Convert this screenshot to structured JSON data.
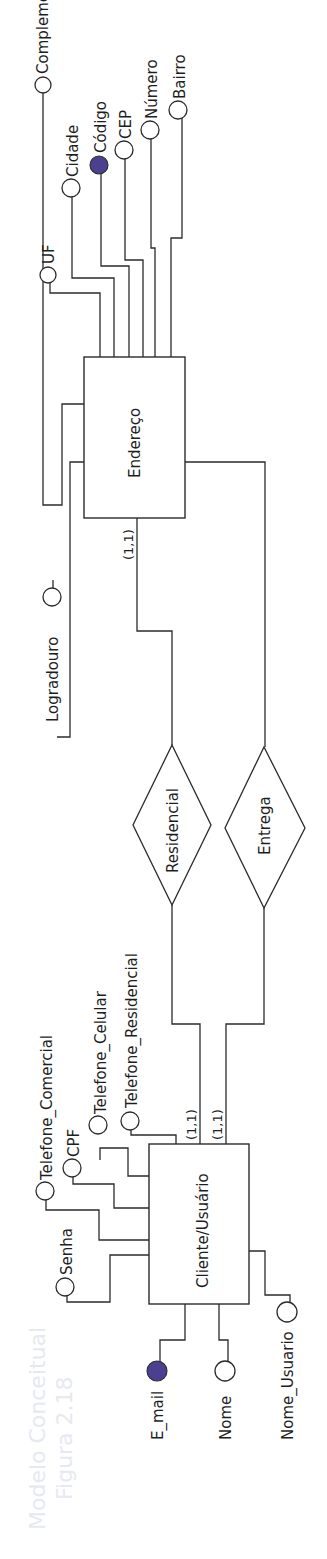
{
  "figure": {
    "orientation": "rotated-90-ccw",
    "background_bleed_text": [
      "Figura 2.18",
      "Modelo Conceitual"
    ],
    "colors": {
      "line": "#2b2b2b",
      "identifier_fill": "#4b3f8f",
      "background": "#ffffff"
    }
  },
  "entities": {
    "endereco": {
      "label": "Endereço"
    },
    "cliente": {
      "label": "Cliente/Usuário"
    }
  },
  "relationships": {
    "residencial": {
      "label": "Residencial",
      "card_endereco": "(1,1)",
      "card_cliente": "(1,1)"
    },
    "entrega": {
      "label": "Entrega",
      "card_cliente": "(1,1)"
    }
  },
  "attributes": {
    "endereco": [
      {
        "label": "UF",
        "identifier": false
      },
      {
        "label": "Cidade",
        "identifier": false
      },
      {
        "label": "Código",
        "identifier": true
      },
      {
        "label": "CEP",
        "identifier": false
      },
      {
        "label": "Número",
        "identifier": false
      },
      {
        "label": "Bairro",
        "identifier": false
      },
      {
        "label": "Complemento",
        "identifier": false
      },
      {
        "label": "Logradouro",
        "identifier": false
      }
    ],
    "cliente": [
      {
        "label": "Telefone_Comercial",
        "identifier": false
      },
      {
        "label": "CPF",
        "identifier": false
      },
      {
        "label": "Telefone_Celular",
        "identifier": false
      },
      {
        "label": "Telefone_Residencial",
        "identifier": false
      },
      {
        "label": "Senha",
        "identifier": false
      },
      {
        "label": "E_mail",
        "identifier": true
      },
      {
        "label": "Nome",
        "identifier": false
      },
      {
        "label": "Nome_Usuario",
        "identifier": false
      }
    ]
  }
}
